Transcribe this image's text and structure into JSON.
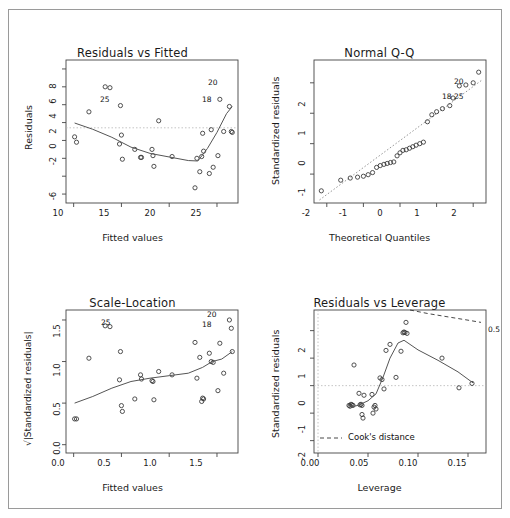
{
  "figure": {
    "kind": "r-regression-diagnostic-plots",
    "border_color": "#9a9a9a",
    "background": "#ffffff",
    "point_color": "#333333",
    "line_color": "#555555",
    "dashed_color": "#9a9a9a"
  },
  "chart_data": [
    {
      "id": "residuals-vs-fitted",
      "type": "scatter",
      "title": "Residuals vs Fitted",
      "xlabel": "Fitted values",
      "ylabel": "Residuals",
      "xlim": [
        9.2,
        27.2
      ],
      "ylim": [
        -7.0,
        9.0
      ],
      "xticks": [
        10,
        15,
        20,
        25
      ],
      "yticks": [
        8,
        6,
        4,
        2,
        0,
        -2,
        -4,
        -6
      ],
      "xticklabels": [
        "10",
        "15",
        "20",
        "25"
      ],
      "yticklabels": [
        "8",
        "6",
        "4",
        "2",
        "0",
        "-2",
        "-4",
        "-6"
      ],
      "grid": false,
      "zero_reference_line": 0,
      "x": [
        10.1,
        10.3,
        11.6,
        13.3,
        13.8,
        14.8,
        14.9,
        15.0,
        15.1,
        16.4,
        17.0,
        17.1,
        18.2,
        18.3,
        18.4,
        18.9,
        20.3,
        22.7,
        22.9,
        23.2,
        23.4,
        23.5,
        23.6,
        24.2,
        24.4,
        24.6,
        25.1,
        25.3,
        25.7,
        26.3,
        26.5,
        26.6
      ],
      "y": [
        0.4,
        -0.2,
        3.2,
        6.0,
        5.9,
        -0.4,
        3.9,
        0.6,
        -2.1,
        -1.0,
        -1.9,
        -1.9,
        -1.0,
        -1.7,
        -2.9,
        2.2,
        -1.8,
        -5.3,
        -2.0,
        -3.5,
        -1.8,
        0.8,
        -1.2,
        -3.7,
        1.2,
        -3.0,
        -1.7,
        4.6,
        1.0,
        3.8,
        1.0,
        0.9
      ],
      "smoother": {
        "x": [
          10.1,
          12.0,
          14.0,
          16.0,
          18.0,
          20.0,
          22.0,
          23.0,
          24.0,
          25.0,
          26.0,
          26.6
        ],
        "y": [
          1.95,
          1.25,
          0.35,
          -0.75,
          -1.45,
          -1.85,
          -2.25,
          -2.3,
          -0.9,
          0.9,
          3.0,
          3.8
        ]
      },
      "outlier_labels": [
        {
          "text": "20",
          "x": 26.3,
          "y": 6.9
        },
        {
          "text": "18",
          "x": 25.8,
          "y": 5.9
        },
        {
          "text": "25",
          "x": 13.4,
          "y": 6.0
        }
      ]
    },
    {
      "id": "normal-qq",
      "type": "scatter",
      "title": "Normal Q-Q",
      "xlabel": "Theoretical Quantiles",
      "ylabel": "Standardized residuals",
      "xlim": [
        -2.35,
        2.35
      ],
      "ylim": [
        -1.95,
        2.75
      ],
      "xticks": [
        -2,
        -1,
        0,
        1,
        2
      ],
      "yticks": [
        2,
        1,
        0,
        -1
      ],
      "xticklabels": [
        "-2",
        "-1",
        "0",
        "1",
        "2"
      ],
      "yticklabels": [
        "2",
        "1",
        "0",
        "-1"
      ],
      "grid": false,
      "reference_line": {
        "type": "qq-dotted",
        "x": [
          -2.2,
          2.25
        ],
        "y": [
          -1.85,
          2.1
        ]
      },
      "x": [
        -2.15,
        -1.62,
        -1.36,
        -1.16,
        -1.0,
        -0.87,
        -0.75,
        -0.64,
        -0.54,
        -0.44,
        -0.35,
        -0.26,
        -0.17,
        -0.08,
        0.0,
        0.08,
        0.17,
        0.26,
        0.35,
        0.44,
        0.54,
        0.64,
        0.75,
        0.87,
        1.0,
        1.16,
        1.36,
        1.45,
        1.62,
        1.8,
        2.0,
        2.15
      ],
      "y": [
        -1.55,
        -1.2,
        -1.13,
        -1.1,
        -1.07,
        -1.02,
        -0.95,
        -0.78,
        -0.72,
        -0.68,
        -0.65,
        -0.62,
        -0.6,
        -0.4,
        -0.3,
        -0.22,
        -0.2,
        -0.15,
        -0.1,
        -0.05,
        0.0,
        0.05,
        0.72,
        0.95,
        1.05,
        1.15,
        1.25,
        1.5,
        1.9,
        1.93,
        2.0,
        2.35
      ],
      "outlier_labels": [
        {
          "text": "20",
          "x": 2.0,
          "y": 2.35
        },
        {
          "text": "18",
          "x": 1.58,
          "y": 1.95
        },
        {
          "text": "25",
          "x": 1.78,
          "y": 1.93
        }
      ]
    },
    {
      "id": "scale-location",
      "type": "scatter",
      "title": "Scale-Location",
      "xlabel": "Fitted values",
      "ylabel": "√|Standardized residuals|",
      "xlim": [
        9.2,
        27.2
      ],
      "ylim": [
        -0.1,
        1.62
      ],
      "xticks": [
        10,
        15,
        20,
        25
      ],
      "yticks": [
        0.0,
        0.5,
        1.0,
        1.5
      ],
      "xticklabels": [
        "0.0",
        "0.5",
        "1.0",
        "1.5"
      ],
      "yticklabels": [
        "1.5",
        "1.0",
        "0.5",
        "0.0"
      ],
      "grid": false,
      "x": [
        10.1,
        10.3,
        11.6,
        13.3,
        13.8,
        14.8,
        14.9,
        15.0,
        15.1,
        16.4,
        17.0,
        17.1,
        18.2,
        18.3,
        18.4,
        18.9,
        20.3,
        22.7,
        22.9,
        23.2,
        23.4,
        23.5,
        23.6,
        24.2,
        24.4,
        24.6,
        25.1,
        25.3,
        25.7,
        26.3,
        26.5,
        26.6
      ],
      "y": [
        0.31,
        0.31,
        1.04,
        1.43,
        1.42,
        0.78,
        1.12,
        0.47,
        0.4,
        0.55,
        0.84,
        0.79,
        0.77,
        0.76,
        0.54,
        0.88,
        0.84,
        1.23,
        0.8,
        1.05,
        0.52,
        0.56,
        0.55,
        1.1,
        1.0,
        0.99,
        0.65,
        1.22,
        0.86,
        1.5,
        1.4,
        1.12
      ],
      "smoother": {
        "x": [
          10.1,
          12.0,
          14.0,
          16.0,
          18.0,
          20.0,
          22.0,
          23.5,
          24.5,
          25.5,
          26.6
        ],
        "y": [
          0.5,
          0.58,
          0.68,
          0.76,
          0.8,
          0.83,
          0.86,
          0.93,
          1.0,
          1.03,
          1.12
        ]
      },
      "outlier_labels": [
        {
          "text": "20",
          "x": 26.2,
          "y": 1.5
        },
        {
          "text": "18",
          "x": 25.9,
          "y": 1.4
        },
        {
          "text": "25",
          "x": 13.6,
          "y": 1.43
        }
      ]
    },
    {
      "id": "residuals-vs-leverage",
      "type": "scatter",
      "title": "Residuals vs Leverage",
      "xlabel": "Leverage",
      "ylabel": "Standardized residuals",
      "xlim": [
        -0.004,
        0.168
      ],
      "ylim": [
        -2.45,
        2.75
      ],
      "xticks": [
        0.0,
        0.05,
        0.1,
        0.15
      ],
      "yticks": [
        2,
        1,
        0,
        -1,
        -2
      ],
      "xticklabels": [
        "0.00",
        "0.05",
        "0.10",
        "0.15"
      ],
      "yticklabels": [
        "2",
        "1",
        "0",
        "-1",
        "-2"
      ],
      "grid": false,
      "zero_reference_line": 0,
      "vertical_reference_line": 0.0,
      "cooks_label": "Cook's distance",
      "cooks_contour_label": "0.5",
      "x": [
        0.031,
        0.032,
        0.033,
        0.034,
        0.035,
        0.036,
        0.041,
        0.042,
        0.043,
        0.044,
        0.044,
        0.045,
        0.046,
        0.054,
        0.055,
        0.056,
        0.057,
        0.058,
        0.062,
        0.064,
        0.066,
        0.068,
        0.072,
        0.078,
        0.083,
        0.085,
        0.086,
        0.087,
        0.088,
        0.089,
        0.124,
        0.141,
        0.154
      ],
      "y": [
        -0.72,
        -0.75,
        -0.68,
        -0.7,
        -0.72,
        0.75,
        -0.28,
        -0.7,
        -0.68,
        -0.72,
        -1.05,
        -1.18,
        -0.35,
        -0.32,
        -1.0,
        -0.78,
        -0.72,
        -0.85,
        0.28,
        0.22,
        -0.12,
        1.28,
        1.5,
        0.3,
        1.25,
        1.92,
        1.95,
        1.93,
        2.3,
        1.9,
        1.0,
        -0.08,
        0.08
      ],
      "smoother": {
        "x": [
          0.031,
          0.04,
          0.05,
          0.058,
          0.065,
          0.072,
          0.08,
          0.086,
          0.1,
          0.12,
          0.14,
          0.155
        ],
        "y": [
          -0.78,
          -0.72,
          -0.55,
          -0.3,
          0.3,
          1.0,
          1.55,
          1.65,
          1.3,
          0.92,
          0.5,
          0.1
        ]
      },
      "cooks_contour": {
        "x": [
          0.092,
          0.11,
          0.13,
          0.15,
          0.163
        ],
        "y": [
          2.75,
          2.62,
          2.5,
          2.38,
          2.3
        ]
      }
    }
  ]
}
